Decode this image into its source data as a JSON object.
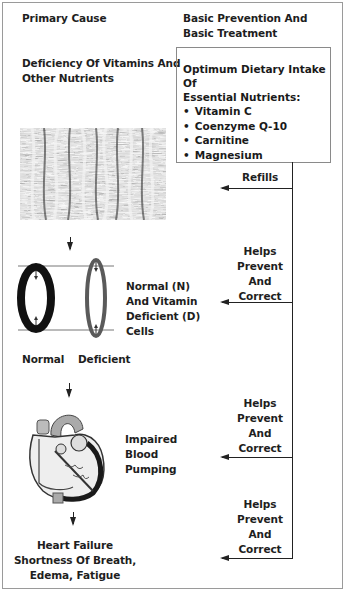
{
  "headers": {
    "left": "Primary Cause",
    "right_line1": "Basic Prevention And",
    "right_line2": "Basic Treatment"
  },
  "cause": {
    "line1": "Deficiency Of Vitamins And",
    "line2": "Other Nutrients"
  },
  "nutrient_box": {
    "head_line1": "Optimum Dietary Intake Of",
    "head_line2": "Essential Nutrients:",
    "items": [
      "Vitamin C",
      "Coenzyme Q-10",
      "Carnitine",
      "Magnesium"
    ]
  },
  "arrows": [
    {
      "lines": [
        "Refills"
      ]
    },
    {
      "lines": [
        "Helps",
        "Prevent",
        "And",
        "Correct"
      ]
    },
    {
      "lines": [
        "Helps",
        "Prevent",
        "And",
        "Correct"
      ]
    },
    {
      "lines": [
        "Helps",
        "Prevent",
        "And",
        "Correct"
      ]
    }
  ],
  "cells": {
    "normal_label": "Normal",
    "deficient_label": "Deficient",
    "caption_lines": [
      "Normal (N)",
      "And Vitamin",
      "Deficient (D)",
      "Cells"
    ]
  },
  "heart": {
    "caption_lines": [
      "Impaired",
      "Blood",
      "Pumping"
    ]
  },
  "outcome": {
    "lines": [
      "Heart Failure",
      "Shortness Of Breath,",
      "Edema, Fatigue"
    ]
  },
  "colors": {
    "line": "#222222",
    "frame": "#9a9a9a",
    "deficient_cell": "#5a5a5a",
    "normal_cell": "#111111"
  }
}
